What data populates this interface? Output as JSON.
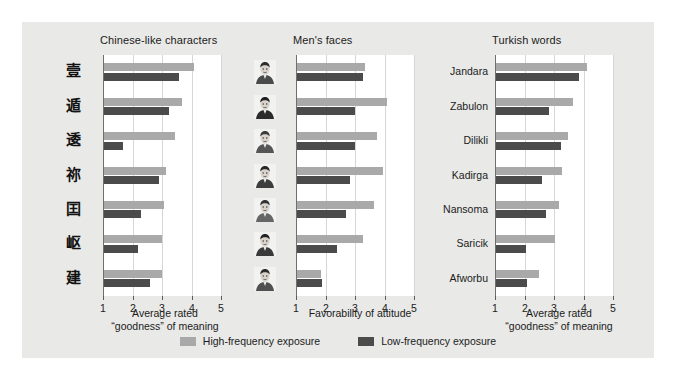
{
  "figure": {
    "background_color": "#e9e9e7",
    "plot_background": "#ffffff"
  },
  "legend": {
    "high_label": "High-frequency exposure",
    "low_label": "Low-frequency exposure",
    "high_color": "#a9a9a9",
    "low_color": "#4b4b4b"
  },
  "panels": [
    {
      "title": "Chinese-like characters",
      "axis_caption": "Average rated\n“goodness” of meaning",
      "ticks": [
        "1",
        "2",
        "3",
        "4",
        "5"
      ],
      "row_labels": [
        "壹",
        "遁",
        "逶",
        "祢",
        "囯",
        "岖",
        "建"
      ]
    },
    {
      "title": "Men's faces",
      "axis_caption": "Favorability of attitude",
      "ticks": [
        "1",
        "2",
        "3",
        "4",
        "5"
      ],
      "row_labels": [
        "face-1",
        "face-2",
        "face-3",
        "face-4",
        "face-5",
        "face-6",
        "face-7"
      ]
    },
    {
      "title": "Turkish words",
      "axis_caption": "Average rated\n“goodness” of meaning",
      "ticks": [
        "1",
        "2",
        "3",
        "4",
        "5"
      ],
      "row_labels": [
        "Jandara",
        "Zabulon",
        "Dilikli",
        "Kadirga",
        "Nansoma",
        "Saricik",
        "Afworbu"
      ]
    }
  ],
  "chart_data": [
    {
      "type": "bar",
      "title": "Chinese-like characters",
      "orientation": "horizontal",
      "xlabel": "Average rated “goodness” of meaning",
      "ylabel": "",
      "xlim": [
        1,
        5
      ],
      "xticks": [
        1,
        2,
        3,
        4,
        5
      ],
      "grid": true,
      "legend_position": "bottom-center",
      "categories": [
        "char-1",
        "char-2",
        "char-3",
        "char-4",
        "char-5",
        "char-6",
        "char-7"
      ],
      "series": [
        {
          "name": "High-frequency exposure",
          "color": "#a9a9a9",
          "values": [
            4.05,
            3.65,
            3.4,
            3.1,
            3.05,
            2.95,
            2.95
          ]
        },
        {
          "name": "Low-frequency exposure",
          "color": "#4b4b4b",
          "values": [
            3.55,
            3.2,
            1.65,
            2.85,
            2.25,
            2.15,
            2.55
          ]
        }
      ]
    },
    {
      "type": "bar",
      "title": "Men's faces",
      "orientation": "horizontal",
      "xlabel": "Favorability of attitude",
      "ylabel": "",
      "xlim": [
        1,
        5
      ],
      "xticks": [
        1,
        2,
        3,
        4,
        5
      ],
      "grid": true,
      "legend_position": "bottom-center",
      "categories": [
        "face-1",
        "face-2",
        "face-3",
        "face-4",
        "face-5",
        "face-6",
        "face-7"
      ],
      "series": [
        {
          "name": "High-frequency exposure",
          "color": "#a9a9a9",
          "values": [
            3.3,
            4.05,
            3.7,
            3.9,
            3.6,
            3.25,
            1.8
          ]
        },
        {
          "name": "Low-frequency exposure",
          "color": "#4b4b4b",
          "values": [
            3.25,
            2.95,
            2.95,
            2.8,
            2.65,
            2.35,
            1.85
          ]
        }
      ]
    },
    {
      "type": "bar",
      "title": "Turkish words",
      "orientation": "horizontal",
      "xlabel": "Average rated “goodness” of meaning",
      "ylabel": "",
      "xlim": [
        1,
        5
      ],
      "xticks": [
        1,
        2,
        3,
        4,
        5
      ],
      "grid": true,
      "legend_position": "bottom-center",
      "categories": [
        "Jandara",
        "Zabulon",
        "Dilikli",
        "Kadirga",
        "Nansoma",
        "Saricik",
        "Afworbu"
      ],
      "series": [
        {
          "name": "High-frequency exposure",
          "color": "#a9a9a9",
          "values": [
            4.1,
            3.6,
            3.45,
            3.25,
            3.15,
            3.0,
            2.45
          ]
        },
        {
          "name": "Low-frequency exposure",
          "color": "#4b4b4b",
          "values": [
            3.8,
            2.8,
            3.2,
            2.55,
            2.7,
            2.0,
            2.05
          ]
        }
      ]
    }
  ]
}
